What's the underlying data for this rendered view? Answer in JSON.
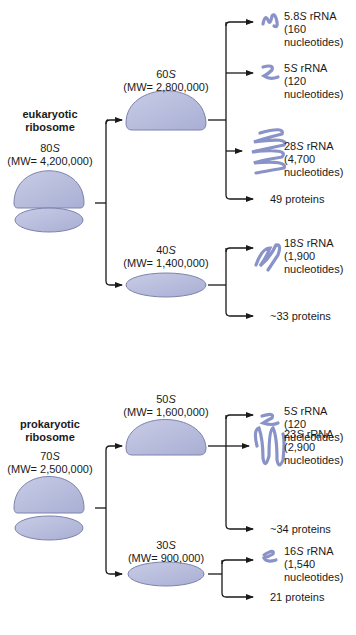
{
  "eukaryotic": {
    "title_line1": "eukaryotic",
    "title_line2": "ribosome",
    "whole": {
      "s": "80",
      "s_unit": "S",
      "mw": "(MW= 4,200,000)"
    },
    "large": {
      "s": "60",
      "s_unit": "S",
      "mw": "(MW= 2,800,000)",
      "components": [
        {
          "name": "5.8",
          "unit": "S",
          "suffix": " rRNA",
          "count": "(160",
          "count2": "nucleotides)"
        },
        {
          "name": "5",
          "unit": "S",
          "suffix": " rRNA",
          "count": "(120",
          "count2": "nucleotides)"
        },
        {
          "name": "28",
          "unit": "S",
          "suffix": " rRNA",
          "count": "(4,700",
          "count2": "nucleotides)"
        }
      ],
      "proteins": "49 proteins"
    },
    "small": {
      "s": "40",
      "s_unit": "S",
      "mw": "(MW= 1,400,000)",
      "components": [
        {
          "name": "18",
          "unit": "S",
          "suffix": " rRNA",
          "count": "(1,900",
          "count2": "nucleotides)"
        }
      ],
      "proteins": "~33 proteins"
    }
  },
  "prokaryotic": {
    "title_line1": "prokaryotic",
    "title_line2": "ribosome",
    "whole": {
      "s": "70",
      "s_unit": "S",
      "mw": "(MW= 2,500,000)"
    },
    "large": {
      "s": "50",
      "s_unit": "S",
      "mw": "(MW= 1,600,000)",
      "components": [
        {
          "name": "5",
          "unit": "S",
          "suffix": " rRNA",
          "count": "(120",
          "count2": "nucleotides)"
        },
        {
          "name": "23",
          "unit": "S",
          "suffix": " rRNA",
          "count": "(2,900",
          "count2": "nucleotides)"
        }
      ],
      "proteins": "~34 proteins"
    },
    "small": {
      "s": "30",
      "s_unit": "S",
      "mw": "(MW= 900,000)",
      "components": [
        {
          "name": "16",
          "unit": "S",
          "suffix": " rRNA",
          "count": "(1,540",
          "count2": "nucleotides)"
        }
      ],
      "proteins": "21 proteins"
    }
  },
  "colors": {
    "subunit_fill": "#b9bedd",
    "subunit_stroke": "#7d82ad",
    "rna": "#8a93c8",
    "line": "#1a1a1a"
  }
}
